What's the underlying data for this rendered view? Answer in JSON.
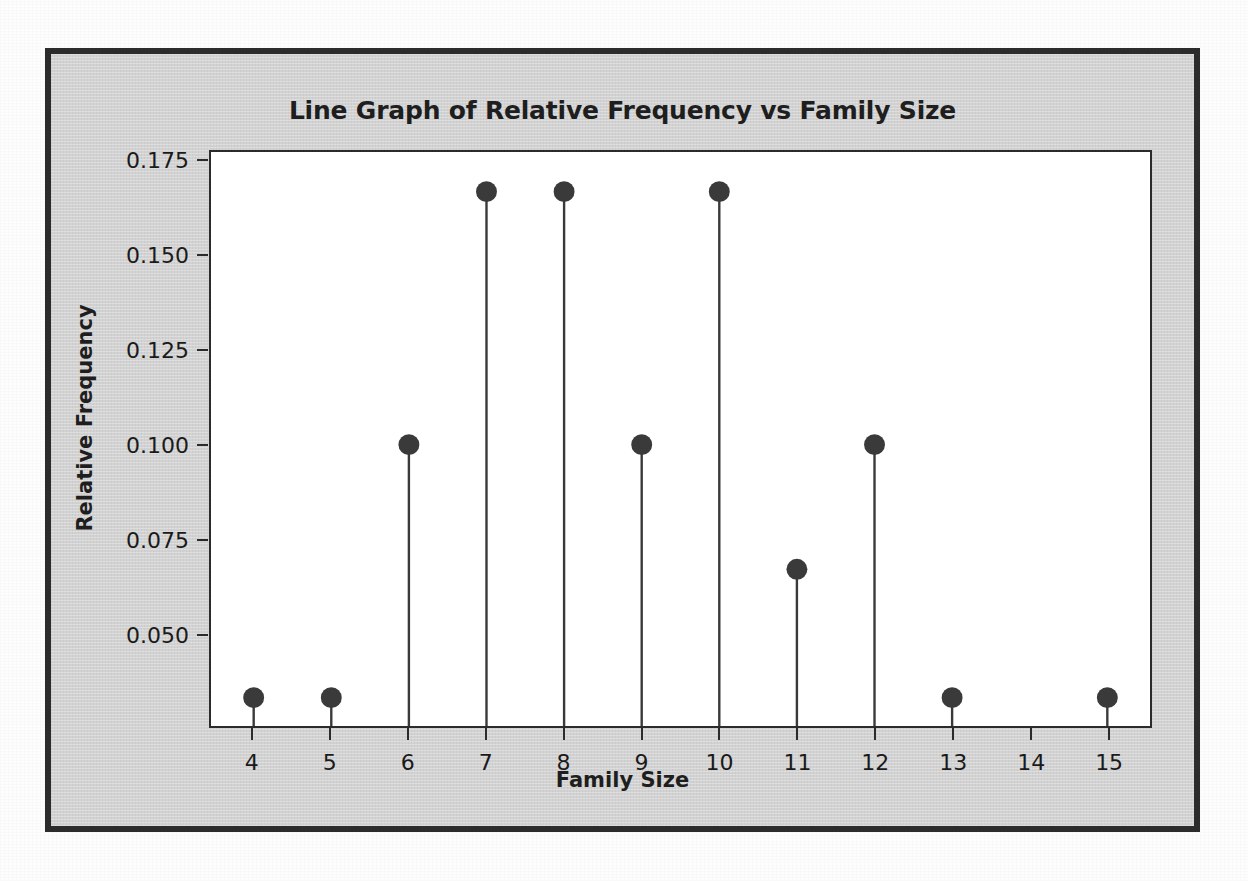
{
  "chart_data": {
    "type": "line",
    "title": "Line Graph of Relative Frequency vs Family Size",
    "subtitle": "",
    "xlabel": "Family Size",
    "ylabel": "Relative Frequency",
    "categories": [
      4,
      5,
      6,
      7,
      8,
      9,
      10,
      11,
      12,
      13,
      14,
      15
    ],
    "x_tick_labels": [
      "4",
      "5",
      "6",
      "7",
      "8",
      "9",
      "10",
      "11",
      "12",
      "13",
      "14",
      "15"
    ],
    "values": [
      0.033,
      0.033,
      0.1,
      0.167,
      0.167,
      0.1,
      0.167,
      0.067,
      0.1,
      0.033,
      null,
      0.033
    ],
    "y_tick_labels": [
      "0.175",
      "0.150",
      "0.125",
      "0.100",
      "0.075",
      "0.050"
    ],
    "y_ticks": [
      0.175,
      0.15,
      0.125,
      0.1,
      0.075,
      0.05
    ],
    "ylim": [
      0.0255,
      0.1775
    ],
    "xlim": [
      3.45,
      15.55
    ],
    "grid": false,
    "legend": "none",
    "marker": "filled-circle",
    "marker_color": "#3a3a3a",
    "stem_color": "#3a3a3a",
    "plot_background": "#ffffff",
    "figure_background": "#d2d2d2",
    "frame_color": "#2c2c2c",
    "text_color": "#1e1e1e",
    "points": [
      {
        "x": 4,
        "y": 0.033,
        "has_marker": true
      },
      {
        "x": 5,
        "y": 0.033,
        "has_marker": true
      },
      {
        "x": 6,
        "y": 0.1,
        "has_marker": true
      },
      {
        "x": 7,
        "y": 0.167,
        "has_marker": true
      },
      {
        "x": 8,
        "y": 0.167,
        "has_marker": true
      },
      {
        "x": 9,
        "y": 0.1,
        "has_marker": true
      },
      {
        "x": 10,
        "y": 0.167,
        "has_marker": true
      },
      {
        "x": 11,
        "y": 0.067,
        "has_marker": true
      },
      {
        "x": 12,
        "y": 0.1,
        "has_marker": true
      },
      {
        "x": 13,
        "y": 0.033,
        "has_marker": true
      },
      {
        "x": 14,
        "y": null,
        "has_marker": false
      },
      {
        "x": 15,
        "y": 0.033,
        "has_marker": true
      }
    ]
  }
}
